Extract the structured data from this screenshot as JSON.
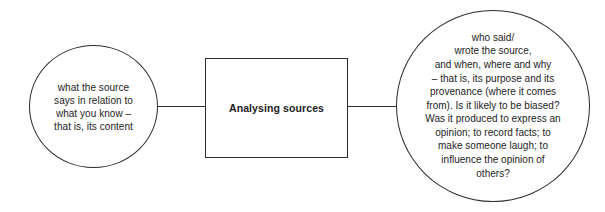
{
  "diagram": {
    "title": "Analysing sources",
    "type": "concept-map",
    "nodes": {
      "center": {
        "label": "Analysing sources",
        "shape": "rectangle"
      },
      "left": {
        "label": "what the source\nsays in relation to\nwhat you know –\nthat is, its content",
        "shape": "ellipse"
      },
      "right": {
        "label": "who said/\nwrote the source,\nand when, where and why\n– that is, its purpose and its\nprovenance (where it comes\nfrom). Is it likely to be biased?\nWas it produced to express an\nopinion; to record facts; to\nmake someone laugh; to\ninfluence the opinion of\nothers?",
        "shape": "ellipse"
      }
    },
    "colors": {
      "stroke": "#2b2b2b",
      "text": "#1d1d1d",
      "background": "#ffffff"
    }
  }
}
